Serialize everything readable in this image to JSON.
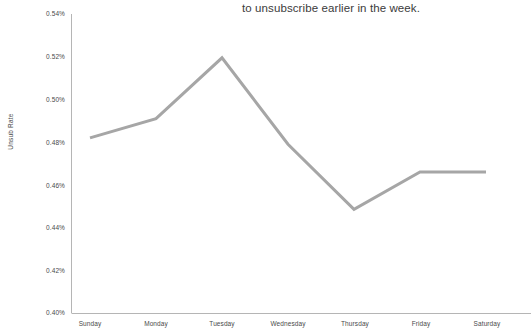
{
  "caption": {
    "text": "to unsubscribe earlier in the week."
  },
  "chart_data": {
    "type": "line",
    "title": "",
    "xlabel": "",
    "ylabel": "Unsub Rate",
    "categories": [
      "Sunday",
      "Monday",
      "Tuesday",
      "Wednesday",
      "Thursday",
      "Friday",
      "Saturday"
    ],
    "values": [
      0.482,
      0.491,
      0.5195,
      0.479,
      0.4485,
      0.466,
      0.466
    ],
    "value_unit": "%",
    "ylim": [
      0.4,
      0.54
    ],
    "ytick_step": 0.02,
    "ytick_labels": [
      "0.54%",
      "0.52%",
      "0.50%",
      "0.48%",
      "0.46%",
      "0.44%",
      "0.42%",
      "0.40%"
    ],
    "ytick_values": [
      0.54,
      0.52,
      0.5,
      0.48,
      0.46,
      0.44,
      0.42,
      0.4
    ],
    "grid": false,
    "legend": "none",
    "series": [
      {
        "name": "Unsub Rate",
        "color": "#a6a6a6",
        "values": [
          0.482,
          0.491,
          0.5195,
          0.479,
          0.4485,
          0.466,
          0.466
        ]
      }
    ],
    "axis_color": "#b5b5b5",
    "line_width": 3
  }
}
